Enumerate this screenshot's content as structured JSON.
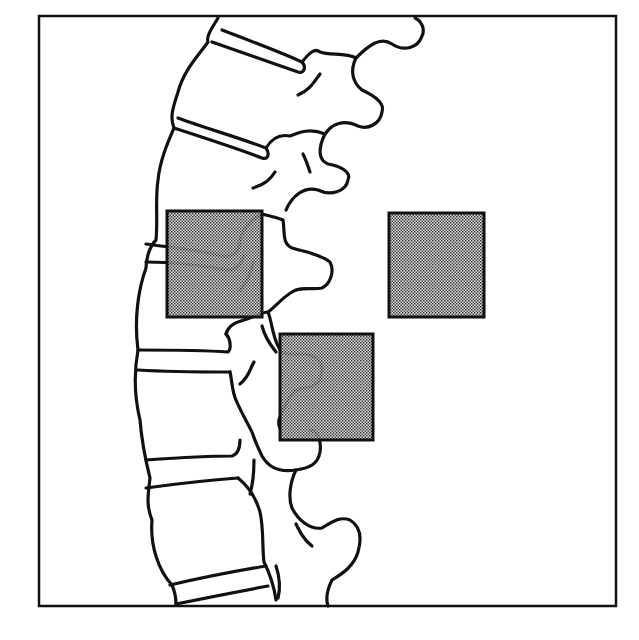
{
  "figure": {
    "frame": {
      "x": 39,
      "y": 16,
      "width": 577,
      "height": 590,
      "stroke": "#111111"
    },
    "colors": {
      "line": "#111111",
      "background": "#ffffff",
      "stipple_light": "#d9d9d9",
      "stipple_dark": "#1a1a1a"
    },
    "regions": [
      {
        "id": "roi-vertebral-upper",
        "label": "",
        "x": 167,
        "y": 211,
        "width": 95,
        "height": 106
      },
      {
        "id": "roi-soft-tissue",
        "label": "",
        "x": 389,
        "y": 213,
        "width": 95,
        "height": 104
      },
      {
        "id": "roi-vertebral-lower",
        "label": "",
        "x": 280,
        "y": 334,
        "width": 93,
        "height": 106
      }
    ]
  }
}
